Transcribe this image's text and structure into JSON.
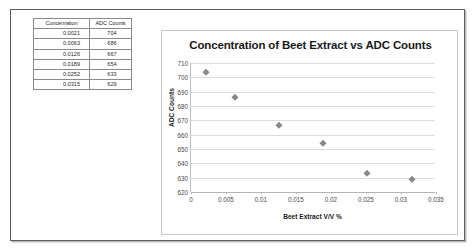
{
  "table": {
    "headers": [
      "Concenration",
      "ADC Counts"
    ],
    "rows": [
      {
        "concentration": "0.0021",
        "counts": "704"
      },
      {
        "concentration": "0.0063",
        "counts": "686"
      },
      {
        "concentration": "0.0126",
        "counts": "667"
      },
      {
        "concentration": "0.0189",
        "counts": "654"
      },
      {
        "concentration": "0.0252",
        "counts": "633"
      },
      {
        "concentration": "0.0315",
        "counts": "629"
      }
    ]
  },
  "chart_data": {
    "type": "scatter",
    "title": "Concentration of Beet Extract vs ADC Counts",
    "xlabel": "Beet Extract V/V %",
    "ylabel": "ADC Counts",
    "x": [
      0.0021,
      0.0063,
      0.0126,
      0.0189,
      0.0252,
      0.0315
    ],
    "y": [
      704,
      686,
      667,
      654,
      633,
      629
    ],
    "xlim": [
      0,
      0.035
    ],
    "ylim": [
      620,
      710
    ],
    "xticks": [
      "0",
      "0.005",
      "0.01",
      "0.015",
      "0.02",
      "0.025",
      "0.03",
      "0.035"
    ],
    "xtick_values": [
      0,
      0.005,
      0.01,
      0.015,
      0.02,
      0.025,
      0.03,
      0.035
    ],
    "yticks": [
      "710",
      "700",
      "690",
      "680",
      "670",
      "660",
      "650",
      "640",
      "630",
      "620"
    ],
    "ytick_values": [
      710,
      700,
      690,
      680,
      670,
      660,
      650,
      640,
      630,
      620
    ],
    "grid": true,
    "legend": false,
    "marker": "diamond",
    "marker_color": "#888888",
    "series": [
      {
        "name": "ADC Counts",
        "points": [
          {
            "x": 0.0021,
            "y": 704
          },
          {
            "x": 0.0063,
            "y": 686
          },
          {
            "x": 0.0126,
            "y": 667
          },
          {
            "x": 0.0189,
            "y": 654
          },
          {
            "x": 0.0252,
            "y": 633
          },
          {
            "x": 0.0315,
            "y": 629
          }
        ]
      }
    ]
  },
  "colors": {
    "frame_border": "#5d5d5d",
    "chart_border": "#c8c8c8",
    "gridline": "#dddddd",
    "text": "#1a1a1a",
    "tick_text": "#4a4a4a"
  }
}
